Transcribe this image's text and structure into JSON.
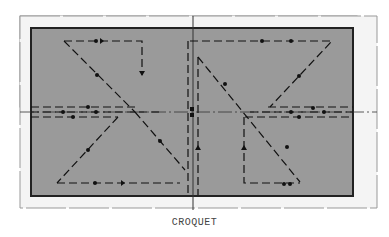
{
  "caption": "CROQUET",
  "colors": {
    "field": "#9a9a9a",
    "border": "#222222",
    "outer_frame": "#888888",
    "path": "#111111",
    "background": "#ffffff"
  },
  "court": {
    "outer_frame": {
      "x": 20,
      "y": 16,
      "w": 158,
      "h": 91
    },
    "field": {
      "x": 31,
      "y": 27,
      "w": 322,
      "h": 160
    }
  }
}
